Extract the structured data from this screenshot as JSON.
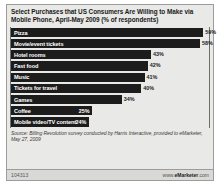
{
  "chart_data": {
    "type": "bar",
    "title": "Select Purchases that US Consumers Are Willing to Make via Mobile Phone, April-May 2009 (% of respondents)",
    "xlabel": "",
    "ylabel": "",
    "xlim": [
      0,
      62
    ],
    "grid": false,
    "legend": null,
    "orientation": "horizontal",
    "categories": [
      "Pizza",
      "Movie/event tickets",
      "Hotel rooms",
      "Fast food",
      "Music",
      "Tickets for travel",
      "Games",
      "Coffee",
      "Mobile video/TV content"
    ],
    "values": [
      59,
      58,
      43,
      42,
      41,
      40,
      34,
      25,
      24
    ],
    "data_labels": [
      "59%",
      "58%",
      "43%",
      "42%",
      "41%",
      "40%",
      "34%",
      "25%",
      "24%"
    ],
    "label_inside": [
      false,
      false,
      false,
      false,
      false,
      false,
      false,
      true,
      true
    ],
    "bar_color": "#1c1c1c",
    "background_color": "#e9e9e7"
  },
  "source": {
    "text": "Source: Billing Revolution survey conducted by Harris Interactive, provided to eMarketer, May 27, 2009"
  },
  "footer": {
    "id": "104313",
    "site_prefix": "www.",
    "site_brand": "eMarketer",
    "site_suffix": ".com"
  }
}
